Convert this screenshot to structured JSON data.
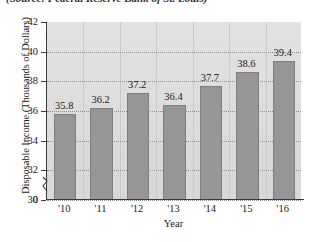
{
  "source_caption": "(Source: Federal Reserve Bank of St. Louis)",
  "chart_data": {
    "type": "bar",
    "title": "",
    "xlabel": "Year",
    "ylabel": "Disposable Income (Thousands of Dollars)",
    "categories": [
      "'10",
      "'11",
      "'12",
      "'13",
      "'14",
      "'15",
      "'16"
    ],
    "values": [
      35.8,
      36.2,
      37.2,
      36.4,
      37.7,
      38.6,
      39.4
    ],
    "value_labels": [
      "35.8",
      "36.2",
      "37.2",
      "36.4",
      "37.7",
      "38.6",
      "39.4"
    ],
    "ylim": [
      30,
      42
    ],
    "y_ticks": [
      30,
      32,
      34,
      36,
      38,
      40,
      42
    ],
    "y_tick_labels": [
      "30",
      "32",
      "34",
      "36",
      "38",
      "40",
      "42"
    ],
    "y_origin_label": "0",
    "axis_break": true,
    "grid": true,
    "grid_style": "dotted",
    "legend": "none",
    "bar_color": "#969696",
    "plot_background": "#dedede",
    "axis_color": "#3a3a3a",
    "gridline_color": "#8e8e8e"
  }
}
